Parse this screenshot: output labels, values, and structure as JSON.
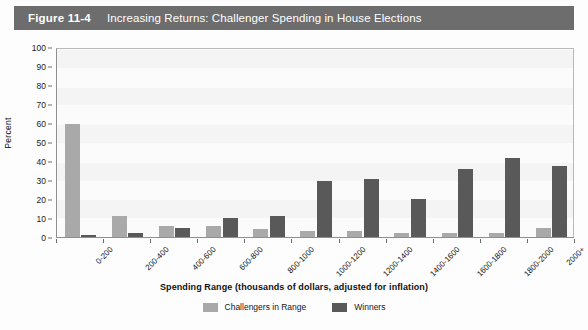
{
  "figure": {
    "number": "Figure 11-4",
    "title": "Increasing Returns: Challenger Spending in House Elections",
    "header_bg": "#6d6d6d",
    "header_text_color": "#ffffff"
  },
  "chart_data": {
    "type": "bar",
    "title": "Increasing Returns: Challenger Spending in House Elections",
    "xlabel": "Spending Range (thousands of dollars, adjusted for inflation)",
    "ylabel": "Percent",
    "ylim": [
      0,
      100
    ],
    "ytick_step": 10,
    "grid": false,
    "legend_position": "bottom-center",
    "categories": [
      "0-200",
      "200-400",
      "400-600",
      "600-800",
      "800-1000",
      "1000-1200",
      "1200-1400",
      "1400-1600",
      "1600-1800",
      "1800-2000",
      "2000+"
    ],
    "yticks": [
      "0",
      "10",
      "20",
      "30",
      "40",
      "50",
      "60",
      "70",
      "80",
      "90",
      "100"
    ],
    "series": [
      {
        "name": "Challengers in Range",
        "color": "#a9a9a9",
        "values": [
          60,
          11,
          6,
          6,
          4,
          3,
          3,
          2,
          2,
          2,
          5
        ]
      },
      {
        "name": "Winners",
        "color": "#595959",
        "values": [
          1,
          2,
          5,
          10,
          11,
          30,
          31,
          20,
          36,
          42,
          38
        ]
      }
    ]
  }
}
